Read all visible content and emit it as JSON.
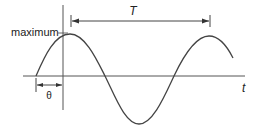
{
  "diagram": {
    "labels": {
      "maximum": "maximum",
      "period": "T",
      "phase": "θ",
      "time_axis": "t"
    },
    "colors": {
      "stroke": "#444444",
      "text": "#222222",
      "background": "#ffffff"
    }
  }
}
